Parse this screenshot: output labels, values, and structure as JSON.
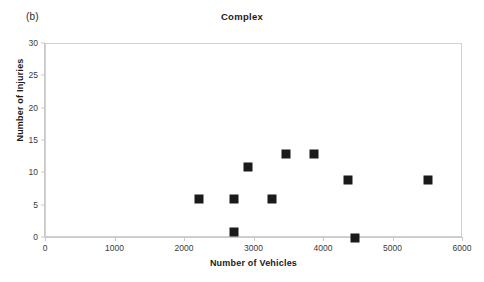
{
  "panel": {
    "letter": "(b)"
  },
  "chart_data": {
    "type": "scatter",
    "title": "Complex",
    "xlabel": "Number of Vehicles",
    "ylabel": "Number of Injuries",
    "xlim": [
      0,
      6000
    ],
    "ylim": [
      0,
      30
    ],
    "xticks": [
      0,
      1000,
      2000,
      3000,
      4000,
      5000,
      6000
    ],
    "xtick_labels": [
      "0",
      "1000",
      "2000",
      "3000",
      "4000",
      "5000",
      "6000"
    ],
    "yticks": [
      0,
      5,
      10,
      15,
      20,
      25,
      30
    ],
    "ytick_labels": [
      "0",
      "5",
      "10",
      "15",
      "20",
      "25",
      "30"
    ],
    "grid": false,
    "legend": null,
    "marker": {
      "shape": "square",
      "color": "#1a1a1a",
      "size_px": 9
    },
    "points": [
      {
        "x": 2200,
        "y": 6
      },
      {
        "x": 2700,
        "y": 6
      },
      {
        "x": 2700,
        "y": 1
      },
      {
        "x": 2900,
        "y": 11
      },
      {
        "x": 3250,
        "y": 6
      },
      {
        "x": 3450,
        "y": 13
      },
      {
        "x": 3850,
        "y": 13
      },
      {
        "x": 4350,
        "y": 9
      },
      {
        "x": 4450,
        "y": 0
      },
      {
        "x": 5500,
        "y": 9
      }
    ],
    "series": [
      {
        "name": "Complex",
        "x": [
          2200,
          2700,
          2700,
          2900,
          3250,
          3450,
          3850,
          4350,
          4450,
          5500
        ],
        "values": [
          6,
          6,
          1,
          11,
          6,
          13,
          13,
          9,
          0,
          9
        ]
      }
    ]
  },
  "colors": {
    "marker": "#1a1a1a",
    "axis": "#c9c9c9",
    "frame": "#d2d2d2",
    "text": "#1b1b1b",
    "background": "#ffffff"
  }
}
